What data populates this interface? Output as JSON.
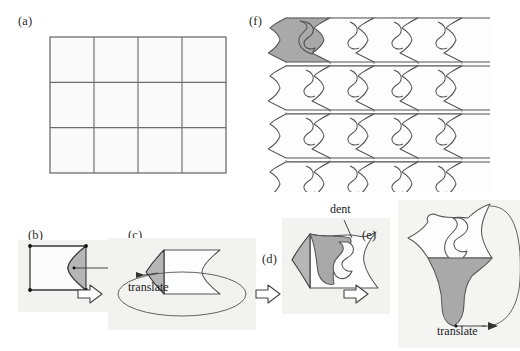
{
  "figure": {
    "background": "#ffffff",
    "width": 520,
    "height": 351
  },
  "colors": {
    "shade_gray": "#a9a9a9",
    "dent_gray": "#b6b6b6",
    "outline": "#555555",
    "grid": "#6e6e6e",
    "panel_bg": "#f2f2f0",
    "text": "#222222"
  },
  "panels": [
    {
      "id": "a",
      "label": "(a)",
      "caption_x": 18,
      "caption_y": 14,
      "description": "plain 4 by 3 grid of squares",
      "grid": {
        "cols": 4,
        "rows": 3,
        "x": 50,
        "y": 37,
        "w": 176,
        "h": 136
      }
    },
    {
      "id": "b",
      "label": "(b)",
      "caption_x": 28,
      "caption_y": 228,
      "description": "single square tile with corner dots and a concave dent cut into its right edge"
    },
    {
      "id": "c",
      "label": "(c)",
      "caption_x": 128,
      "caption_y": 228,
      "description": "the dent translated to the left edge so it becomes a matching bump"
    },
    {
      "id": "d",
      "label": "(d)",
      "caption_x": 262,
      "caption_y": 255,
      "description": "a second dent cut from the top edge of the tile"
    },
    {
      "id": "e",
      "label": "(e)",
      "caption_x": 362,
      "caption_y": 228,
      "description": "final bird shaped tile after the second translation"
    },
    {
      "id": "f",
      "label": "(f)",
      "caption_x": 249,
      "caption_y": 14,
      "description": "the finished tile tessellating the plane, one copy shaded"
    }
  ],
  "annotations": [
    {
      "id": "dent-b",
      "text": "dent",
      "x": 118,
      "y": 252,
      "panel": "b"
    },
    {
      "id": "translate-c",
      "text": "translate",
      "x": 128,
      "y": 286,
      "panel": "c"
    },
    {
      "id": "dent-d",
      "text": "dent",
      "x": 330,
      "y": 208,
      "panel": "d"
    },
    {
      "id": "translate-e",
      "text": "translate",
      "x": 437,
      "y": 330,
      "panel": "e"
    }
  ],
  "arrows": {
    "step_arrow_label": "proceeds-to",
    "count": 3,
    "positions": [
      {
        "x": 79,
        "y": 283
      },
      {
        "x": 258,
        "y": 283
      },
      {
        "x": 345,
        "y": 283
      }
    ]
  }
}
